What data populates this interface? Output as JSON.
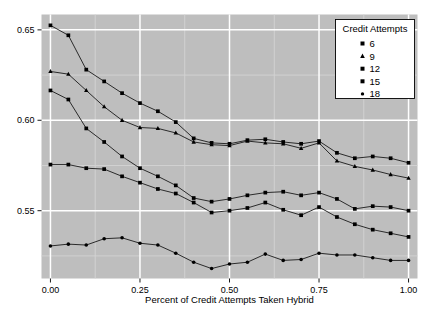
{
  "chart_data": {
    "type": "line",
    "title": "",
    "xlabel": "Percent of Credit Attempts Taken Hybrid",
    "ylabel": "",
    "xlim": [
      -0.025,
      1.025
    ],
    "ylim": [
      0.5125,
      0.6585
    ],
    "xticks": [
      0.0,
      0.25,
      0.5,
      0.75,
      1.0
    ],
    "xticklabels": [
      "0.00",
      "0.25",
      "0.50",
      "0.75",
      "1.00"
    ],
    "yticks": [
      0.55,
      0.6,
      0.65
    ],
    "yticklabels": [
      "0.55",
      "0.60",
      "0.65"
    ],
    "grid": true,
    "legend": {
      "title": "Credit Attempts",
      "position": "top-right",
      "entries": [
        {
          "label": "6",
          "marker": "square"
        },
        {
          "label": "9",
          "marker": "triangle"
        },
        {
          "label": "12",
          "marker": "square"
        },
        {
          "label": "15",
          "marker": "square"
        },
        {
          "label": "18",
          "marker": "dot"
        }
      ]
    },
    "x": [
      0.0,
      0.05,
      0.1,
      0.15,
      0.2,
      0.25,
      0.3,
      0.35,
      0.4,
      0.45,
      0.5,
      0.55,
      0.6,
      0.65,
      0.7,
      0.75,
      0.8,
      0.85,
      0.9,
      0.95,
      1.0
    ],
    "series": [
      {
        "name": "6",
        "marker": "square",
        "values": [
          0.6525,
          0.647,
          0.628,
          0.6215,
          0.615,
          0.6095,
          0.605,
          0.599,
          0.59,
          0.5875,
          0.587,
          0.589,
          0.5895,
          0.588,
          0.587,
          0.5885,
          0.582,
          0.579,
          0.58,
          0.579,
          0.5765
        ]
      },
      {
        "name": "9",
        "marker": "triangle",
        "values": [
          0.627,
          0.6255,
          0.6165,
          0.6075,
          0.6,
          0.596,
          0.5955,
          0.593,
          0.588,
          0.5865,
          0.586,
          0.5885,
          0.5875,
          0.587,
          0.5845,
          0.5875,
          0.5775,
          0.5745,
          0.5725,
          0.57,
          0.568
        ]
      },
      {
        "name": "12",
        "marker": "square",
        "values": [
          0.6165,
          0.6115,
          0.5955,
          0.588,
          0.58,
          0.5735,
          0.569,
          0.564,
          0.557,
          0.555,
          0.5565,
          0.5585,
          0.56,
          0.5605,
          0.5585,
          0.56,
          0.5565,
          0.551,
          0.5525,
          0.552,
          0.55
        ]
      },
      {
        "name": "15",
        "marker": "square",
        "values": [
          0.5755,
          0.5755,
          0.5735,
          0.573,
          0.569,
          0.5655,
          0.562,
          0.5595,
          0.5545,
          0.549,
          0.55,
          0.5515,
          0.5545,
          0.5505,
          0.5475,
          0.552,
          0.5465,
          0.5425,
          0.5395,
          0.5375,
          0.5355
        ]
      },
      {
        "name": "18",
        "marker": "dot",
        "values": [
          0.5305,
          0.5315,
          0.531,
          0.5345,
          0.535,
          0.532,
          0.531,
          0.5265,
          0.5215,
          0.518,
          0.5205,
          0.5215,
          0.526,
          0.5225,
          0.523,
          0.5265,
          0.5255,
          0.5255,
          0.524,
          0.5225,
          0.5225
        ]
      }
    ]
  },
  "style": {
    "panel_background": "#BEBEBE",
    "major_grid": "#FFFFFF",
    "minor_grid": "#D4D4D4",
    "line_color": "#1A1A1A",
    "point_color": "#000000",
    "legend_background": "#FFFFFF",
    "legend_border": "#000000",
    "tick_color": "#000000",
    "text_color": "#000000"
  }
}
